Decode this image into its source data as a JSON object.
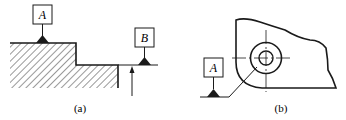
{
  "figures": [
    {
      "id": "a",
      "caption": "(a)",
      "datum_labels": [
        "A",
        "B"
      ],
      "description": "Stepped hatched part with datum A on top surface and datum B on extension of lower surface"
    },
    {
      "id": "b",
      "caption": "(b)",
      "datum_labels": [
        "A"
      ],
      "description": "Plate with concentric circles; datum A leader attached to outer circle"
    }
  ],
  "colors": {
    "line": "#1a1a1a",
    "background": "#ffffff"
  }
}
